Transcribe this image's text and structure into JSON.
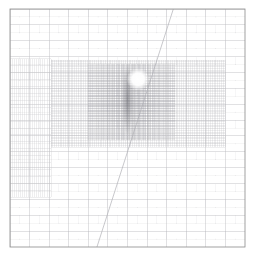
{
  "figure": {
    "title": "",
    "background_color": "#ffffff",
    "width": 254,
    "height": 265
  },
  "frame": {
    "name": "plot-frame",
    "x0": 10,
    "y0": 9,
    "x1": 245,
    "y1": 247,
    "stroke": "#8a8a8a",
    "stroke_width": 0.8,
    "fill": "#ffffff"
  },
  "chart_data": {
    "type": "heatmap",
    "title": "",
    "subtitle": "",
    "xlabel": "",
    "ylabel": "",
    "xlim": [
      0,
      1
    ],
    "ylim": [
      0,
      1
    ],
    "grid": true,
    "legend": "none",
    "levels": [
      {
        "level": 0,
        "name": "base-grid",
        "cols": 12,
        "rows": 15,
        "cell_width": 19.6,
        "cell_height": 15.9,
        "stroke": "#b9b9bd",
        "stroke_width": 0.45,
        "extent": [
          0.0,
          0.0,
          1.0,
          1.0
        ]
      },
      {
        "level": 1,
        "name": "refined-patch-left-band",
        "cols": 20,
        "rows": 20,
        "stroke": "#c6c6ca",
        "stroke_width": 0.35,
        "extent": [
          0.0,
          0.21,
          0.175,
          0.79
        ]
      },
      {
        "level": 2,
        "name": "refined-patch-central-block",
        "cols": 96,
        "rows": 52,
        "stroke": "#bdbdc2",
        "stroke_width": 0.3,
        "extent": [
          0.175,
          0.42,
          0.915,
          0.785
        ]
      },
      {
        "level": 3,
        "name": "refined-patch-core",
        "cols": 70,
        "rows": 46,
        "stroke": "#8f8f96",
        "stroke_width": 0.3,
        "extent": [
          0.33,
          0.45,
          0.7,
          0.77
        ]
      }
    ],
    "features": [
      {
        "name": "dark-vertical-filament",
        "kind": "dense-region",
        "center": [
          0.5,
          0.62
        ],
        "width": 0.045,
        "height": 0.3,
        "intensity": 0.62,
        "color": "#6e6e75"
      },
      {
        "name": "bright-hotspot",
        "kind": "void",
        "center": [
          0.545,
          0.705
        ],
        "radius": 0.048,
        "color": "#ffffff"
      },
      {
        "name": "diagonal-contour",
        "kind": "line",
        "points": [
          [
            0.37,
            0.0
          ],
          [
            0.695,
            1.0
          ]
        ],
        "stroke": "#b0b0b6",
        "stroke_width": 0.7
      }
    ],
    "tick_markers": {
      "name": "cell-center-dots",
      "color": "#cfcfd4",
      "radius": 0.35,
      "visible": true
    }
  },
  "caption": {
    "text": "",
    "visible": false
  }
}
